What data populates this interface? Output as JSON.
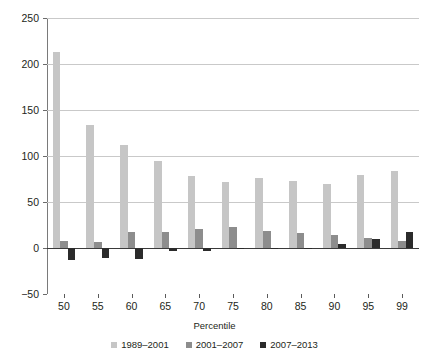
{
  "chart_data": {
    "type": "bar",
    "title": "",
    "subtitle": "",
    "xlabel": "Percentile",
    "ylabel": "",
    "categories": [
      "50",
      "55",
      "60",
      "65",
      "70",
      "75",
      "80",
      "85",
      "90",
      "95",
      "99"
    ],
    "ylim": [
      -50,
      250
    ],
    "yticks": [
      -50,
      0,
      50,
      100,
      150,
      200,
      250
    ],
    "ytick_labels": [
      "−50",
      "0",
      "50",
      "100",
      "150",
      "200",
      "250"
    ],
    "grid": "horizontal",
    "legend_position": "bottom-center",
    "series": [
      {
        "name": "1989–2001",
        "color": "#c6c6c6",
        "values": [
          213,
          134,
          112,
          95,
          78,
          72,
          76,
          73,
          70,
          79,
          84
        ]
      },
      {
        "name": "2001–2007",
        "color": "#8d8d8d",
        "values": [
          8,
          6,
          17,
          17,
          21,
          23,
          19,
          16,
          14,
          11,
          8
        ]
      },
      {
        "name": "2007–2013",
        "color": "#2b2b2b",
        "values": [
          -13,
          -11,
          -12,
          -3,
          -3,
          -1,
          -1,
          -1,
          4,
          10,
          17
        ]
      }
    ]
  },
  "axis": {
    "x_title": "Percentile"
  }
}
